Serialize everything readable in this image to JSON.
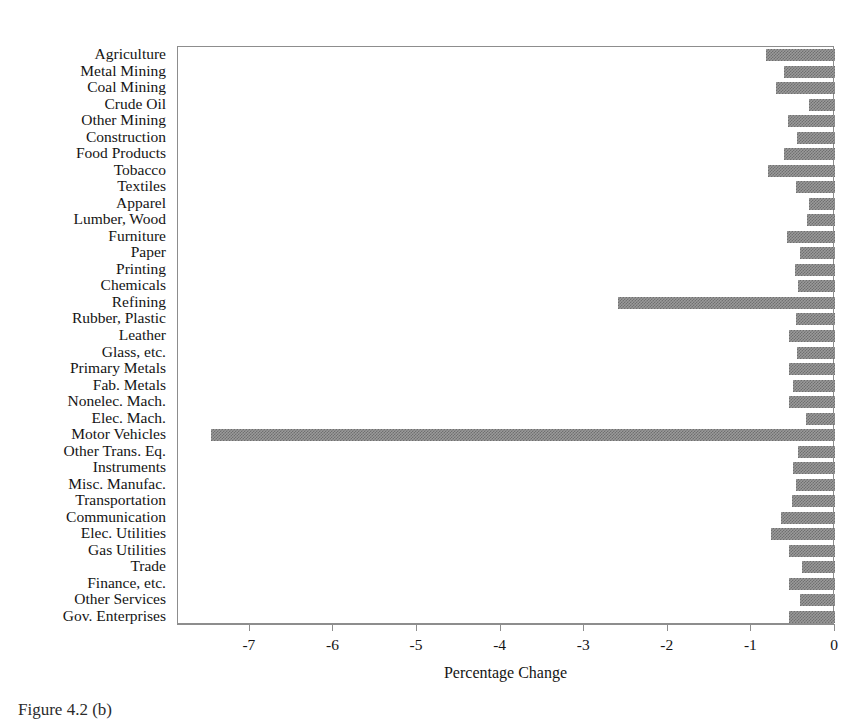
{
  "chart_data": {
    "type": "bar",
    "orientation": "horizontal",
    "title": "",
    "xlabel": "Percentage Change",
    "ylabel": "",
    "xlim": [
      -7.86,
      0.0
    ],
    "xticks": [
      -7,
      -6,
      -5,
      -4,
      -3,
      -2,
      -1,
      0
    ],
    "xticklabels": [
      "-7",
      "-6",
      "-5",
      "-4",
      "-3",
      "-2",
      "-1",
      "0"
    ],
    "grid": false,
    "legend": null,
    "bar_color": "#9a9a9a",
    "bar_pattern": "checkerboard-gray",
    "frame_color": "#8d8d8d",
    "categories": [
      "Agriculture",
      "Metal Mining",
      "Coal Mining",
      "Crude Oil",
      "Other Mining",
      "Construction",
      "Food Products",
      "Tobacco",
      "Textiles",
      "Apparel",
      "Lumber, Wood",
      "Furniture",
      "Paper",
      "Printing",
      "Chemicals",
      "Refining",
      "Rubber, Plastic",
      "Leather",
      "Glass, etc.",
      "Primary Metals",
      "Fab. Metals",
      "Nonelec. Mach.",
      "Elec. Mach.",
      "Motor Vehicles",
      "Other Trans. Eq.",
      "Instruments",
      "Misc. Manufac.",
      "Transportation",
      "Communication",
      "Elec. Utilities",
      "Gas Utilities",
      "Trade",
      "Finance, etc.",
      "Other Services",
      "Gov. Enterprises"
    ],
    "values": [
      -0.83,
      -0.61,
      -0.71,
      -0.31,
      -0.56,
      -0.46,
      -0.61,
      -0.8,
      -0.47,
      -0.31,
      -0.33,
      -0.57,
      -0.42,
      -0.48,
      -0.44,
      -2.6,
      -0.47,
      -0.55,
      -0.46,
      -0.55,
      -0.5,
      -0.55,
      -0.35,
      -7.47,
      -0.44,
      -0.5,
      -0.47,
      -0.52,
      -0.65,
      -0.76,
      -0.55,
      -0.39,
      -0.55,
      -0.42,
      -0.55
    ]
  },
  "caption": {
    "text": "Figure 4.2 (b)"
  }
}
